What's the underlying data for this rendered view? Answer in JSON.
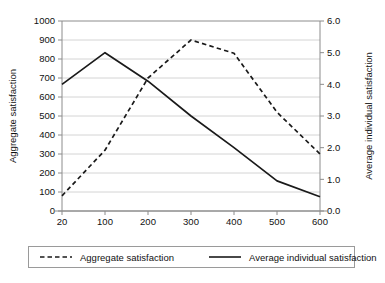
{
  "chart_data": {
    "type": "line",
    "title": "",
    "xlabel": "Persons present",
    "categories": [
      "20",
      "100",
      "200",
      "300",
      "400",
      "500",
      "600"
    ],
    "grid": true,
    "legend_position": "bottom",
    "axes": {
      "left": {
        "label": "Aggregate satisfaction",
        "min": 0,
        "max": 1000,
        "step": 100,
        "ticks": [
          "0",
          "100",
          "200",
          "300",
          "400",
          "500",
          "600",
          "700",
          "800",
          "900",
          "1000"
        ]
      },
      "right": {
        "label": "Average individual satisfaction",
        "min": 0.0,
        "max": 6.0,
        "step": 1.0,
        "ticks": [
          "0.0",
          "1.0",
          "2.0",
          "3.0",
          "4.0",
          "5.0",
          "6.0"
        ]
      }
    },
    "series": [
      {
        "name": "Aggregate satisfaction",
        "axis": "left",
        "style": "dashed",
        "color": "#1a1a1a",
        "values": [
          80,
          320,
          700,
          900,
          830,
          520,
          300
        ]
      },
      {
        "name": "Average individual satisfaction",
        "axis": "right",
        "style": "solid",
        "color": "#1a1a1a",
        "values": [
          4.0,
          5.0,
          4.1,
          3.0,
          2.0,
          0.95,
          0.45
        ]
      }
    ]
  },
  "legend": {
    "items": [
      {
        "label": "Aggregate satisfaction",
        "style": "dashed"
      },
      {
        "label": "Average individual satisfaction",
        "style": "solid"
      }
    ]
  }
}
